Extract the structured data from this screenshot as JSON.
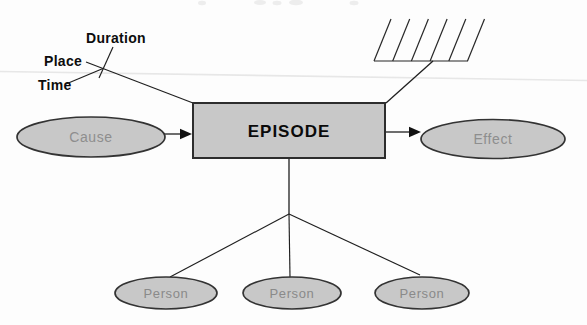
{
  "figure": {
    "kind": "episode-schema-diagram",
    "top_left_attributes": {
      "items": [
        {
          "label": "Duration"
        },
        {
          "label": "Place"
        },
        {
          "label": "Time"
        }
      ]
    },
    "cause_node": {
      "label": "Cause"
    },
    "episode_node": {
      "label": "EPISODE"
    },
    "effect_node": {
      "label": "Effect"
    },
    "person_nodes": {
      "items": [
        {
          "label": "Person"
        },
        {
          "label": "Person"
        },
        {
          "label": "Person"
        }
      ]
    },
    "hatch": {
      "name": "diagonal-hatch-mark",
      "stroke_count": 6
    }
  },
  "colors": {
    "background": "#fdfdfd",
    "node_fill": "#c8c8c8",
    "node_stroke": "#333333",
    "edge": "#1f1f1f",
    "attribute_text": "#0d0d0d",
    "gray_node_text": "#8e8e8e",
    "scan_artifact": "#e7e7e7"
  }
}
